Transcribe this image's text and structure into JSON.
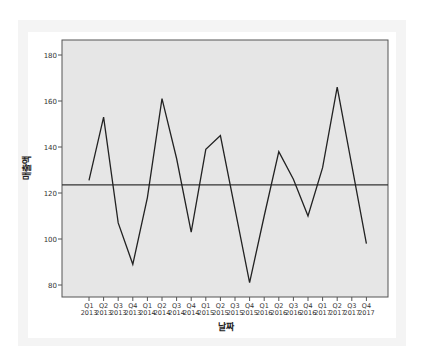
{
  "chart_data": {
    "type": "line",
    "title": "",
    "xlabel": "날짜",
    "ylabel": "매출액",
    "ylim": [
      75,
      185
    ],
    "yticks": [
      80,
      100,
      120,
      140,
      160,
      180
    ],
    "categories": [
      "Q1 2013",
      "Q2 2013",
      "Q3 2013",
      "Q4 2013",
      "Q1 2014",
      "Q2 2014",
      "Q3 2014",
      "Q4 2014",
      "Q1 2015",
      "Q2 2015",
      "Q3 2015",
      "Q4 2015",
      "Q1 2016",
      "Q2 2016",
      "Q3 2016",
      "Q4 2016",
      "Q1 2017",
      "Q2 2017",
      "Q3 2017",
      "Q4 2017"
    ],
    "series": [
      {
        "name": "매출액",
        "values": [
          125.5,
          153,
          107,
          89,
          118,
          161,
          135,
          103,
          139,
          145,
          113,
          81,
          110,
          138,
          126,
          110,
          131,
          166,
          132,
          98
        ]
      }
    ],
    "reference_line": {
      "name": "mean",
      "value": 123.5
    },
    "grid": false,
    "legend": "none"
  },
  "labels": {
    "x_axis_title": "날짜",
    "y_axis_title": "매출액"
  }
}
